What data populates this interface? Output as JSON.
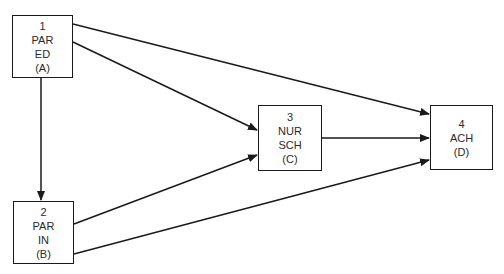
{
  "diagram": {
    "type": "path-diagram",
    "colors": {
      "stroke": "#1a1a1a",
      "text": "#2a2a2a",
      "background": "#ffffff"
    },
    "nodes": [
      {
        "id": "A",
        "number": "1",
        "lines": [
          "PAR",
          "ED"
        ],
        "tag": "(A)"
      },
      {
        "id": "B",
        "number": "2",
        "lines": [
          "PAR",
          "IN"
        ],
        "tag": "(B)"
      },
      {
        "id": "C",
        "number": "3",
        "lines": [
          "NUR",
          "SCH"
        ],
        "tag": "(C)"
      },
      {
        "id": "D",
        "number": "4",
        "lines": [
          "ACH"
        ],
        "tag": "(D)"
      }
    ],
    "edges": [
      {
        "from": "A",
        "to": "B"
      },
      {
        "from": "A",
        "to": "C"
      },
      {
        "from": "A",
        "to": "D"
      },
      {
        "from": "B",
        "to": "C"
      },
      {
        "from": "B",
        "to": "D"
      },
      {
        "from": "C",
        "to": "D"
      }
    ]
  }
}
